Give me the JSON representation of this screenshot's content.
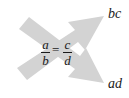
{
  "diagram": {
    "equation": {
      "left": {
        "numerator": "a",
        "denominator": "b"
      },
      "operator": "=",
      "right": {
        "numerator": "c",
        "denominator": "d"
      }
    },
    "products": {
      "top": "bc",
      "bottom": "ad"
    },
    "arrows": [
      {
        "from": "b (bottom-left)",
        "to": "c (top-right)",
        "result": "bc"
      },
      {
        "from": "a (top-left)",
        "to": "d (bottom-right)",
        "result": "ad"
      }
    ],
    "colors": {
      "arrow_fill": "#d3d3d3",
      "text": "#1a1a1a",
      "background": "#ffffff"
    }
  }
}
